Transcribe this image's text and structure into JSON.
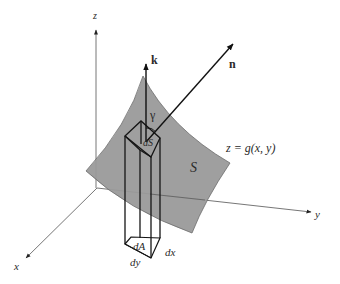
{
  "figure": {
    "axes": {
      "x_label": "x",
      "y_label": "y",
      "z_label": "z"
    },
    "vectors": {
      "k_label": "k",
      "n_label": "n"
    },
    "angle_label": "γ",
    "surface": {
      "name_label": "S",
      "equation_label": "z = g(x, y)",
      "fill_color": "#9a9a9a"
    },
    "elements": {
      "surface_element_label": "dS",
      "area_element_label": "dA",
      "dx_label": "dx",
      "dy_label": "dy"
    },
    "colors": {
      "line": "#1a1a1a",
      "axis": "#555555",
      "background": "#ffffff"
    }
  }
}
